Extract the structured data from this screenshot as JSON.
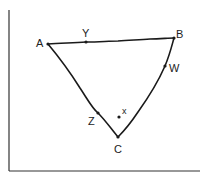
{
  "diagram": {
    "type": "triangle-with-points",
    "colors": {
      "stroke": "#1a1a1a",
      "axis": "#333333",
      "background": "#ffffff"
    },
    "axes": {
      "left_label": "",
      "bottom_label": ""
    },
    "vertices": [
      {
        "id": "A",
        "label": "A"
      },
      {
        "id": "B",
        "label": "B"
      },
      {
        "id": "C",
        "label": "C"
      }
    ],
    "edge_points": [
      {
        "id": "Y",
        "label": "Y",
        "on_edge": "AB"
      },
      {
        "id": "W",
        "label": "W",
        "on_edge": "BC"
      },
      {
        "id": "Z",
        "label": "Z",
        "on_edge": "AC"
      }
    ],
    "interior_points": [
      {
        "id": "x",
        "label": "x"
      }
    ]
  }
}
